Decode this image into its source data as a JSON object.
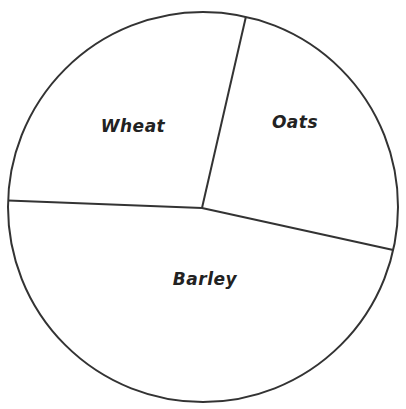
{
  "chart_data": {
    "type": "pie",
    "title": "",
    "categories": [
      "Oats",
      "Barley",
      "Wheat"
    ],
    "values": [
      25,
      47,
      28
    ],
    "unit": "percent (estimated from slice angles)",
    "start_angle_deg": 12.7,
    "direction": "clockwise",
    "labels_inside": true,
    "colors": {
      "fill": "#ffffff",
      "stroke": "#333333",
      "text": "#222222"
    }
  },
  "labels": {
    "wheat": "Wheat",
    "oats": "Oats",
    "barley": "Barley"
  }
}
